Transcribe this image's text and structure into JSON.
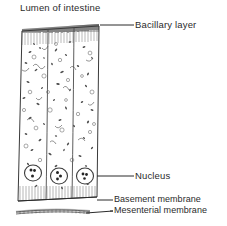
{
  "figure": {
    "title": "Lumen of intestine",
    "background_color": "#ffffff",
    "ink_color": "#2b2b2b",
    "width": 227,
    "height": 226
  },
  "labels": {
    "lumen": "Lumen of intestine",
    "bacillary_layer": "Bacillary layer",
    "nucleus": "Nucleus",
    "basement_membrane": "Basement  membrane",
    "mesenterial_membrane": "Mesenterial  membrane"
  },
  "structures": [
    {
      "name": "lumen-of-intestine",
      "label": "Lumen of intestine",
      "kind": "region-caption"
    },
    {
      "name": "bacillary-layer",
      "label": "Bacillary layer",
      "kind": "dark-hatched-band"
    },
    {
      "name": "columnar-cell-left",
      "label": "",
      "kind": "epithelial-cell"
    },
    {
      "name": "columnar-cell-middle",
      "label": "",
      "kind": "epithelial-cell"
    },
    {
      "name": "columnar-cell-right",
      "label": "",
      "kind": "epithelial-cell"
    },
    {
      "name": "nucleus-left",
      "label": "Nucleus",
      "kind": "oval-nucleus"
    },
    {
      "name": "nucleus-middle",
      "label": "Nucleus",
      "kind": "oval-nucleus"
    },
    {
      "name": "nucleus-right",
      "label": "Nucleus",
      "kind": "oval-nucleus"
    },
    {
      "name": "basement-membrane",
      "label": "Basement  membrane",
      "kind": "solid-line"
    },
    {
      "name": "mesenterial-membrane",
      "label": "Mesenterial  membrane",
      "kind": "thin-wavy-band"
    }
  ],
  "leader_lines": [
    {
      "name": "leader-bacillary-layer",
      "from": [
        100,
        25
      ],
      "to": [
        134,
        25
      ]
    },
    {
      "name": "leader-nucleus",
      "from": [
        97,
        176
      ],
      "to": [
        134,
        176
      ]
    },
    {
      "name": "leader-basement-membrane",
      "from": [
        97,
        200
      ],
      "to": [
        112,
        200
      ]
    },
    {
      "name": "leader-mesenterial-membrane",
      "from": [
        86,
        213
      ],
      "to": [
        112,
        213
      ]
    }
  ]
}
